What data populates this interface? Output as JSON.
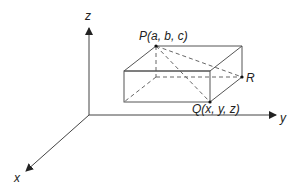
{
  "diagram": {
    "axes": {
      "x_label": "x",
      "y_label": "y",
      "z_label": "z"
    },
    "points": {
      "P": {
        "label": "P(a, b, c)"
      },
      "Q": {
        "label": "Q(x, y, z)"
      },
      "R": {
        "label": "R"
      }
    },
    "colors": {
      "line": "#555555",
      "text": "#222222",
      "background": "#ffffff"
    }
  }
}
